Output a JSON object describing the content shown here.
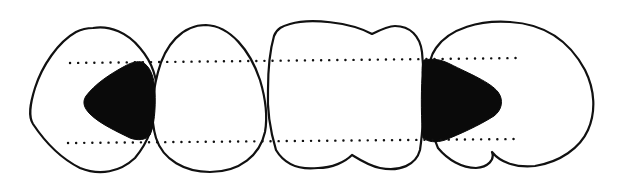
{
  "diagram": {
    "title": "",
    "colors": {
      "background": "#ffffff",
      "outline": "#111111",
      "fill": "#0a0a0a"
    },
    "teeth": [
      {
        "id": "tooth-1",
        "shape": "rounded-triangle"
      },
      {
        "id": "tooth-2",
        "shape": "oval"
      },
      {
        "id": "tooth-3",
        "shape": "lobed-rectangle"
      },
      {
        "id": "tooth-4",
        "shape": "kidney"
      }
    ],
    "shaded_regions": [
      {
        "id": "shaded-left",
        "between": [
          "tooth-1",
          "tooth-2"
        ]
      },
      {
        "id": "shaded-right",
        "between": [
          "tooth-3",
          "tooth-4"
        ]
      }
    ],
    "reference_lines": [
      {
        "id": "upper-dotted-line",
        "style": "dotted"
      },
      {
        "id": "lower-dotted-line",
        "style": "dotted"
      }
    ]
  }
}
